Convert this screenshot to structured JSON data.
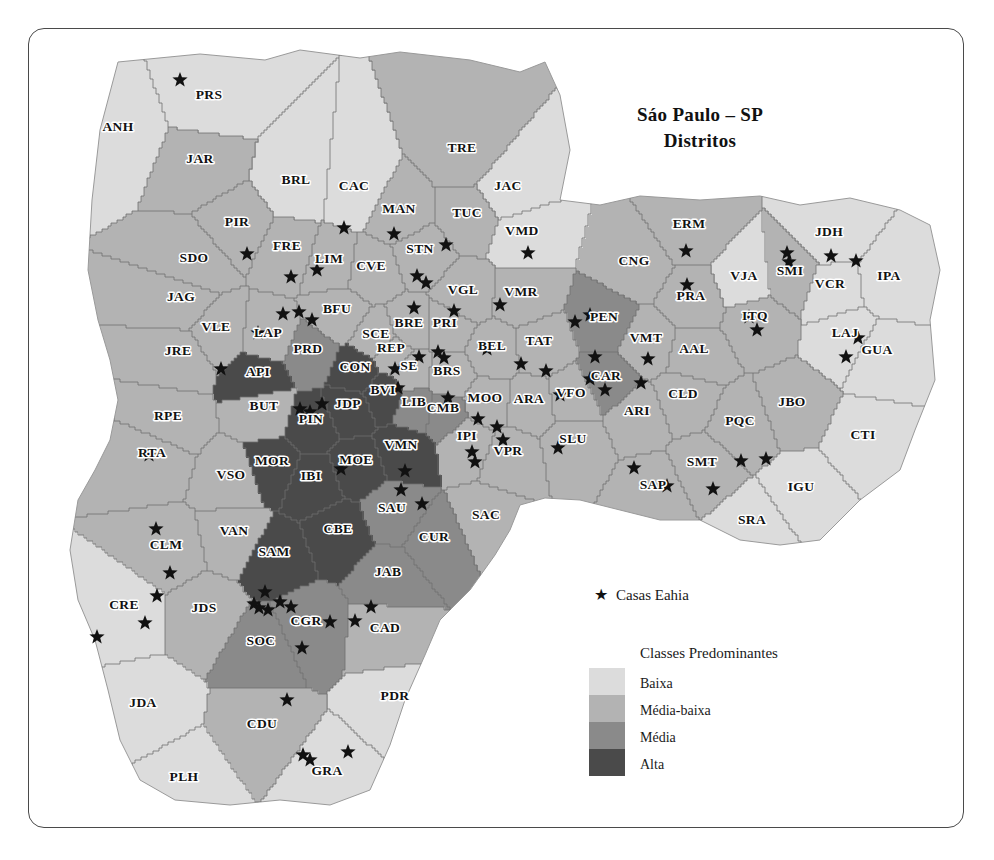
{
  "title": {
    "line1": "Sáo Paulo – SP",
    "line2": "Distritos"
  },
  "legend": {
    "point_symbol": "★",
    "point_label": "Casas Eahia",
    "classes_title": "Classes Predominantes",
    "classes": [
      {
        "label": "Baixa",
        "color": "#dcdcdc"
      },
      {
        "label": "Média-baixa",
        "color": "#b3b3b3"
      },
      {
        "label": "Média",
        "color": "#8a8a8a"
      },
      {
        "label": "Alta",
        "color": "#4a4a4a"
      }
    ]
  },
  "map_data": {
    "type": "choropleth",
    "region": "São Paulo – SP",
    "unit": "Distritos",
    "class_field": "Classes Predominantes",
    "class_levels": [
      "Baixa",
      "Média-baixa",
      "Média",
      "Alta"
    ],
    "class_colors": {
      "Baixa": "#dcdcdc",
      "Média-baixa": "#b3b3b3",
      "Média": "#8a8a8a",
      "Alta": "#4a4a4a"
    },
    "point_layer": "Casas Eahia",
    "districts": [
      {
        "code": "ANH",
        "x": 118,
        "y": 131,
        "class": "Baixa"
      },
      {
        "code": "PRS",
        "x": 209,
        "y": 99,
        "class": "Baixa"
      },
      {
        "code": "JAR",
        "x": 200,
        "y": 163,
        "class": "Média-baixa"
      },
      {
        "code": "BRL",
        "x": 296,
        "y": 184,
        "class": "Baixa"
      },
      {
        "code": "CAC",
        "x": 354,
        "y": 190,
        "class": "Baixa"
      },
      {
        "code": "TRE",
        "x": 462,
        "y": 152,
        "class": "Média-baixa"
      },
      {
        "code": "JAC",
        "x": 508,
        "y": 190,
        "class": "Baixa"
      },
      {
        "code": "MAN",
        "x": 399,
        "y": 213,
        "class": "Média-baixa"
      },
      {
        "code": "TUC",
        "x": 467,
        "y": 217,
        "class": "Média-baixa"
      },
      {
        "code": "VMD",
        "x": 522,
        "y": 235,
        "class": "Baixa"
      },
      {
        "code": "PIR",
        "x": 237,
        "y": 226,
        "class": "Média-baixa"
      },
      {
        "code": "FRE",
        "x": 287,
        "y": 250,
        "class": "Média-baixa"
      },
      {
        "code": "LIM",
        "x": 329,
        "y": 263,
        "class": "Média-baixa"
      },
      {
        "code": "CVE",
        "x": 371,
        "y": 270,
        "class": "Média-baixa"
      },
      {
        "code": "STN",
        "x": 420,
        "y": 253,
        "class": "Média-baixa"
      },
      {
        "code": "SDO",
        "x": 194,
        "y": 262,
        "class": "Média-baixa"
      },
      {
        "code": "JAG",
        "x": 181,
        "y": 301,
        "class": "Média-baixa"
      },
      {
        "code": "VGL",
        "x": 463,
        "y": 294,
        "class": "Média-baixa"
      },
      {
        "code": "VMR",
        "x": 521,
        "y": 296,
        "class": "Média-baixa"
      },
      {
        "code": "ERM",
        "x": 689,
        "y": 228,
        "class": "Média-baixa"
      },
      {
        "code": "CNG",
        "x": 634,
        "y": 265,
        "class": "Média-baixa"
      },
      {
        "code": "PRA",
        "x": 691,
        "y": 300,
        "class": "Média-baixa"
      },
      {
        "code": "VJA",
        "x": 744,
        "y": 280,
        "class": "Baixa"
      },
      {
        "code": "SMI",
        "x": 790,
        "y": 275,
        "class": "Média-baixa"
      },
      {
        "code": "JDH",
        "x": 829,
        "y": 236,
        "class": "Baixa"
      },
      {
        "code": "VCR",
        "x": 830,
        "y": 288,
        "class": "Baixa"
      },
      {
        "code": "IPA",
        "x": 889,
        "y": 280,
        "class": "Baixa"
      },
      {
        "code": "VLE",
        "x": 216,
        "y": 331,
        "class": "Média-baixa"
      },
      {
        "code": "LAP",
        "x": 268,
        "y": 337,
        "class": "Média-baixa"
      },
      {
        "code": "BFU",
        "x": 337,
        "y": 313,
        "class": "Média-baixa"
      },
      {
        "code": "SCE",
        "x": 376,
        "y": 338,
        "class": "Média-baixa"
      },
      {
        "code": "BRE",
        "x": 409,
        "y": 327,
        "class": "Média-baixa"
      },
      {
        "code": "PRI",
        "x": 445,
        "y": 327,
        "class": "Média-baixa"
      },
      {
        "code": "BEL",
        "x": 492,
        "y": 350,
        "class": "Média-baixa"
      },
      {
        "code": "TAT",
        "x": 539,
        "y": 345,
        "class": "Média-baixa"
      },
      {
        "code": "PEN",
        "x": 604,
        "y": 321,
        "class": "Média"
      },
      {
        "code": "VMT",
        "x": 646,
        "y": 342,
        "class": "Média-baixa"
      },
      {
        "code": "AAL",
        "x": 694,
        "y": 353,
        "class": "Média-baixa"
      },
      {
        "code": "ITQ",
        "x": 755,
        "y": 320,
        "class": "Média-baixa"
      },
      {
        "code": "LAJ",
        "x": 845,
        "y": 337,
        "class": "Baixa"
      },
      {
        "code": "GUA",
        "x": 877,
        "y": 354,
        "class": "Baixa"
      },
      {
        "code": "JRE",
        "x": 178,
        "y": 355,
        "class": "Média-baixa"
      },
      {
        "code": "PRD",
        "x": 308,
        "y": 353,
        "class": "Média"
      },
      {
        "code": "REP",
        "x": 391,
        "y": 352,
        "class": "Média-baixa"
      },
      {
        "code": "API",
        "x": 258,
        "y": 376,
        "class": "Alta"
      },
      {
        "code": "CON",
        "x": 355,
        "y": 371,
        "class": "Alta"
      },
      {
        "code": "SE",
        "x": 409,
        "y": 370,
        "class": "Média-baixa"
      },
      {
        "code": "BRS",
        "x": 447,
        "y": 375,
        "class": "Média-baixa"
      },
      {
        "code": "BVI",
        "x": 383,
        "y": 394,
        "class": "Alta"
      },
      {
        "code": "BUT",
        "x": 264,
        "y": 410,
        "class": "Média-baixa"
      },
      {
        "code": "PIN",
        "x": 311,
        "y": 423,
        "class": "Alta"
      },
      {
        "code": "JDP",
        "x": 348,
        "y": 408,
        "class": "Alta"
      },
      {
        "code": "LIB",
        "x": 414,
        "y": 406,
        "class": "Média"
      },
      {
        "code": "CMB",
        "x": 443,
        "y": 412,
        "class": "Média"
      },
      {
        "code": "MOO",
        "x": 485,
        "y": 402,
        "class": "Média-baixa"
      },
      {
        "code": "ARA",
        "x": 529,
        "y": 403,
        "class": "Média-baixa"
      },
      {
        "code": "VFO",
        "x": 571,
        "y": 397,
        "class": "Média-baixa"
      },
      {
        "code": "CAR",
        "x": 606,
        "y": 380,
        "class": "Média"
      },
      {
        "code": "ARI",
        "x": 637,
        "y": 415,
        "class": "Média-baixa"
      },
      {
        "code": "CLD",
        "x": 683,
        "y": 398,
        "class": "Média-baixa"
      },
      {
        "code": "PQC",
        "x": 740,
        "y": 425,
        "class": "Média-baixa"
      },
      {
        "code": "JBO",
        "x": 792,
        "y": 406,
        "class": "Média-baixa"
      },
      {
        "code": "CTI",
        "x": 863,
        "y": 439,
        "class": "Baixa"
      },
      {
        "code": "RPE",
        "x": 168,
        "y": 420,
        "class": "Média-baixa"
      },
      {
        "code": "RTA",
        "x": 152,
        "y": 457,
        "class": "Média-baixa"
      },
      {
        "code": "IPI",
        "x": 467,
        "y": 440,
        "class": "Média-baixa"
      },
      {
        "code": "VPR",
        "x": 508,
        "y": 455,
        "class": "Média-baixa"
      },
      {
        "code": "SLU",
        "x": 573,
        "y": 443,
        "class": "Média-baixa"
      },
      {
        "code": "SMT",
        "x": 702,
        "y": 466,
        "class": "Média-baixa"
      },
      {
        "code": "SAP",
        "x": 653,
        "y": 489,
        "class": "Média-baixa"
      },
      {
        "code": "IGU",
        "x": 801,
        "y": 491,
        "class": "Baixa"
      },
      {
        "code": "SRA",
        "x": 752,
        "y": 524,
        "class": "Baixa"
      },
      {
        "code": "VSO",
        "x": 231,
        "y": 479,
        "class": "Média-baixa"
      },
      {
        "code": "MOR",
        "x": 272,
        "y": 465,
        "class": "Alta"
      },
      {
        "code": "IBI",
        "x": 311,
        "y": 480,
        "class": "Alta"
      },
      {
        "code": "MOE",
        "x": 356,
        "y": 464,
        "class": "Alta"
      },
      {
        "code": "VMN",
        "x": 401,
        "y": 449,
        "class": "Alta"
      },
      {
        "code": "SAU",
        "x": 392,
        "y": 512,
        "class": "Média"
      },
      {
        "code": "CUR",
        "x": 434,
        "y": 541,
        "class": "Média"
      },
      {
        "code": "SAC",
        "x": 486,
        "y": 519,
        "class": "Média-baixa"
      },
      {
        "code": "VAN",
        "x": 234,
        "y": 535,
        "class": "Média-baixa"
      },
      {
        "code": "CBE",
        "x": 338,
        "y": 533,
        "class": "Alta"
      },
      {
        "code": "SAM",
        "x": 274,
        "y": 556,
        "class": "Alta"
      },
      {
        "code": "JAB",
        "x": 388,
        "y": 576,
        "class": "Média"
      },
      {
        "code": "CLM",
        "x": 166,
        "y": 549,
        "class": "Média-baixa"
      },
      {
        "code": "CRE",
        "x": 124,
        "y": 609,
        "class": "Baixa"
      },
      {
        "code": "JDS",
        "x": 204,
        "y": 612,
        "class": "Média-baixa"
      },
      {
        "code": "CGR",
        "x": 306,
        "y": 625,
        "class": "Média"
      },
      {
        "code": "SOC",
        "x": 261,
        "y": 645,
        "class": "Média"
      },
      {
        "code": "CAD",
        "x": 385,
        "y": 632,
        "class": "Média-baixa"
      },
      {
        "code": "JDA",
        "x": 143,
        "y": 707,
        "class": "Baixa"
      },
      {
        "code": "CDU",
        "x": 262,
        "y": 728,
        "class": "Média-baixa"
      },
      {
        "code": "PDR",
        "x": 395,
        "y": 700,
        "class": "Baixa"
      },
      {
        "code": "PLH",
        "x": 184,
        "y": 781,
        "class": "Baixa"
      },
      {
        "code": "GRA",
        "x": 327,
        "y": 775,
        "class": "Baixa"
      }
    ],
    "point_markers": [
      {
        "x": 180,
        "y": 80
      },
      {
        "x": 247,
        "y": 254
      },
      {
        "x": 291,
        "y": 277
      },
      {
        "x": 344,
        "y": 228
      },
      {
        "x": 317,
        "y": 270
      },
      {
        "x": 394,
        "y": 234
      },
      {
        "x": 417,
        "y": 276
      },
      {
        "x": 426,
        "y": 283
      },
      {
        "x": 446,
        "y": 245
      },
      {
        "x": 528,
        "y": 253
      },
      {
        "x": 414,
        "y": 308
      },
      {
        "x": 454,
        "y": 311
      },
      {
        "x": 500,
        "y": 305
      },
      {
        "x": 575,
        "y": 322
      },
      {
        "x": 590,
        "y": 315
      },
      {
        "x": 283,
        "y": 314
      },
      {
        "x": 299,
        "y": 312
      },
      {
        "x": 312,
        "y": 320
      },
      {
        "x": 258,
        "y": 333
      },
      {
        "x": 419,
        "y": 357
      },
      {
        "x": 395,
        "y": 369
      },
      {
        "x": 398,
        "y": 388
      },
      {
        "x": 438,
        "y": 352
      },
      {
        "x": 444,
        "y": 358
      },
      {
        "x": 487,
        "y": 349
      },
      {
        "x": 521,
        "y": 364
      },
      {
        "x": 546,
        "y": 371
      },
      {
        "x": 560,
        "y": 395
      },
      {
        "x": 595,
        "y": 357
      },
      {
        "x": 590,
        "y": 379
      },
      {
        "x": 605,
        "y": 390
      },
      {
        "x": 686,
        "y": 251
      },
      {
        "x": 687,
        "y": 285
      },
      {
        "x": 749,
        "y": 317
      },
      {
        "x": 757,
        "y": 330
      },
      {
        "x": 787,
        "y": 253
      },
      {
        "x": 789,
        "y": 262
      },
      {
        "x": 831,
        "y": 256
      },
      {
        "x": 856,
        "y": 261
      },
      {
        "x": 858,
        "y": 338
      },
      {
        "x": 846,
        "y": 357
      },
      {
        "x": 648,
        "y": 359
      },
      {
        "x": 641,
        "y": 383
      },
      {
        "x": 221,
        "y": 369
      },
      {
        "x": 149,
        "y": 455
      },
      {
        "x": 300,
        "y": 409
      },
      {
        "x": 310,
        "y": 412
      },
      {
        "x": 322,
        "y": 404
      },
      {
        "x": 448,
        "y": 398
      },
      {
        "x": 478,
        "y": 419
      },
      {
        "x": 497,
        "y": 427
      },
      {
        "x": 503,
        "y": 440
      },
      {
        "x": 472,
        "y": 452
      },
      {
        "x": 475,
        "y": 462
      },
      {
        "x": 558,
        "y": 448
      },
      {
        "x": 634,
        "y": 468
      },
      {
        "x": 667,
        "y": 486
      },
      {
        "x": 713,
        "y": 489
      },
      {
        "x": 741,
        "y": 461
      },
      {
        "x": 766,
        "y": 459
      },
      {
        "x": 341,
        "y": 469
      },
      {
        "x": 405,
        "y": 471
      },
      {
        "x": 401,
        "y": 490
      },
      {
        "x": 422,
        "y": 504
      },
      {
        "x": 156,
        "y": 529
      },
      {
        "x": 170,
        "y": 573
      },
      {
        "x": 157,
        "y": 596
      },
      {
        "x": 97,
        "y": 637
      },
      {
        "x": 145,
        "y": 623
      },
      {
        "x": 254,
        "y": 604
      },
      {
        "x": 268,
        "y": 610
      },
      {
        "x": 259,
        "y": 608
      },
      {
        "x": 280,
        "y": 602
      },
      {
        "x": 265,
        "y": 592
      },
      {
        "x": 291,
        "y": 607
      },
      {
        "x": 302,
        "y": 648
      },
      {
        "x": 330,
        "y": 622
      },
      {
        "x": 355,
        "y": 621
      },
      {
        "x": 371,
        "y": 607
      },
      {
        "x": 287,
        "y": 700
      },
      {
        "x": 303,
        "y": 755
      },
      {
        "x": 310,
        "y": 760
      },
      {
        "x": 348,
        "y": 752
      }
    ]
  }
}
